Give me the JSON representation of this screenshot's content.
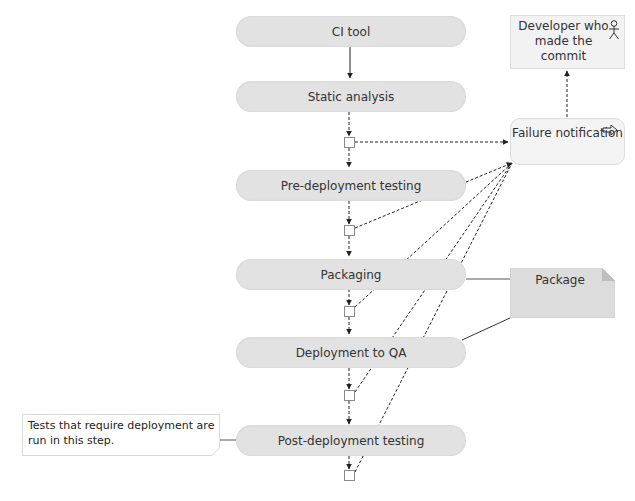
{
  "diagram": {
    "type": "activity-diagram",
    "steps": [
      {
        "id": "ci-tool",
        "label": "CI tool"
      },
      {
        "id": "static-analysis",
        "label": "Static analysis"
      },
      {
        "id": "pre-deployment-testing",
        "label": "Pre-deployment testing"
      },
      {
        "id": "packaging",
        "label": "Packaging"
      },
      {
        "id": "deployment-to-qa",
        "label": "Deployment to QA"
      },
      {
        "id": "post-deployment-testing",
        "label": "Post-deployment testing"
      }
    ],
    "failure_notification": {
      "label": "Failure notification",
      "icon": "send-arrow-icon"
    },
    "developer": {
      "label": "Developer who made the commit",
      "icon": "actor-icon"
    },
    "artifact": {
      "label": "Package",
      "icon": "document-folded-corner"
    },
    "note": {
      "text": "Tests that require deployment are run in this step."
    },
    "colors": {
      "pill_fill": "#e2e2e2",
      "box_fill": "#f2f2f2",
      "package_fill": "#dcdcdc",
      "line": "#333333",
      "junction_border": "#8a8a8a"
    }
  }
}
